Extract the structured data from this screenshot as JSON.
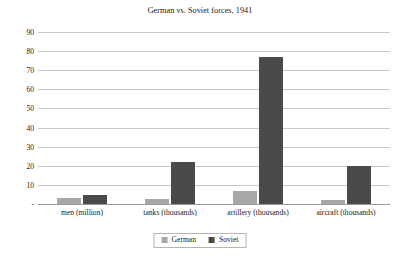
{
  "chart_data": {
    "type": "bar",
    "title": "German vs. Soviet forces, 1941",
    "xlabel": "",
    "ylabel": "",
    "categories": [
      "men (million)",
      "tanks (thousands)",
      "artillery (thousands)",
      "aircraft (thousands)"
    ],
    "series": [
      {
        "name": "German",
        "color": "#a8a8a8",
        "values": [
          3.0,
          2.7,
          6.6,
          2.1
        ]
      },
      {
        "name": "Soviet",
        "color": "#4a4a4a",
        "values": [
          4.8,
          22.0,
          77.0,
          20.0
        ]
      }
    ],
    "ylim": [
      0,
      90
    ],
    "yticks": [
      0,
      10,
      20,
      30,
      40,
      50,
      60,
      70,
      80,
      90
    ],
    "ytick_labels": [
      "-",
      "10",
      "20",
      "30",
      "40",
      "50",
      "60",
      "70",
      "80",
      "90"
    ],
    "grid": "horizontal",
    "legend_position": "bottom",
    "legend_entries": [
      "German",
      "Soviet"
    ]
  }
}
